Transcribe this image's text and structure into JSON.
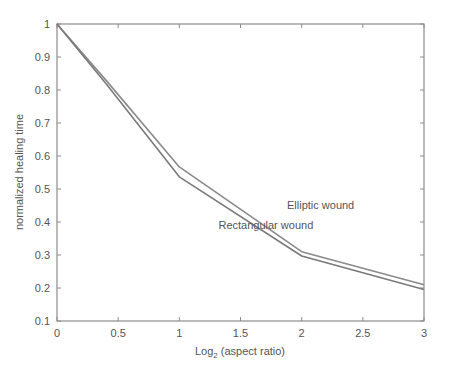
{
  "chart_data": {
    "type": "line",
    "title": "",
    "xlabel": "Log2 (aspect ratio)",
    "xlabel_main": "Log",
    "xlabel_sub": "2",
    "xlabel_rest": " (aspect ratio)",
    "ylabel": "normalized healing time",
    "xlim": [
      0,
      3
    ],
    "ylim": [
      0.1,
      1
    ],
    "xticks": [
      0,
      0.5,
      1,
      1.5,
      2,
      2.5,
      3
    ],
    "xtick_labels": [
      "0",
      "0.5",
      "1",
      "1.5",
      "2",
      "2.5",
      "3"
    ],
    "yticks": [
      0.1,
      0.2,
      0.3,
      0.4,
      0.5,
      0.6,
      0.7,
      0.8,
      0.9,
      1
    ],
    "ytick_labels": [
      "0.1",
      "0.2",
      "0.3",
      "0.4",
      "0.5",
      "0.6",
      "0.7",
      "0.8",
      "0.9",
      "1"
    ],
    "grid": false,
    "legend": "none (inline annotations)",
    "x": [
      0,
      0.4,
      1,
      2,
      3
    ],
    "series": [
      {
        "name": "Elliptic wound",
        "values": [
          1.0,
          0.83,
          0.567,
          0.31,
          0.21
        ],
        "color": "#8a8a8a"
      },
      {
        "name": "Rectangular wound",
        "values": [
          1.0,
          0.82,
          0.537,
          0.297,
          0.195
        ],
        "color": "#7a7a7a"
      }
    ],
    "annotations": [
      {
        "text": "Elliptic wound",
        "x": 1.88,
        "y": 0.44
      },
      {
        "text": "Rectangular wound",
        "x": 1.32,
        "y": 0.38
      }
    ]
  }
}
